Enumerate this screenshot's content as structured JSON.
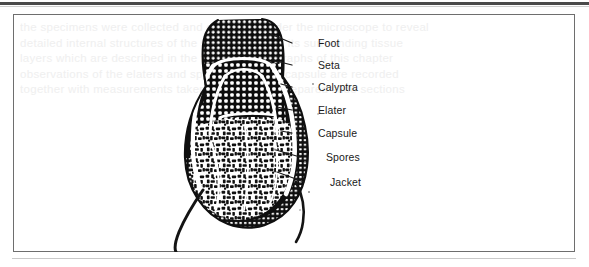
{
  "figure": {
    "kind": "botanical-line-drawing",
    "frame": {
      "border_color": "#6e6e6e",
      "background": "#ffffff"
    },
    "ink_color": "#111111",
    "rules": {
      "top_rule_color": "#4a4a4a",
      "bottom_rule_color": "#c9c9c9"
    }
  },
  "labels": [
    {
      "text": "Foot",
      "x": 318,
      "y": 38,
      "leader_from_x": 292,
      "leader_from_y": 43,
      "tip_x": 268,
      "tip_y": 33
    },
    {
      "text": "Seta",
      "x": 318,
      "y": 60,
      "leader_from_x": 292,
      "leader_from_y": 65,
      "tip_x": 272,
      "tip_y": 60
    },
    {
      "text": "Calyptra",
      "x": 318,
      "y": 82,
      "leader_from_x": 292,
      "leader_from_y": 87,
      "tip_x": 281,
      "tip_y": 84
    },
    {
      "text": "Elater",
      "x": 318,
      "y": 105,
      "leader_from_x": 292,
      "leader_from_y": 110,
      "tip_x": 277,
      "tip_y": 107
    },
    {
      "text": "Capsule",
      "x": 318,
      "y": 128,
      "leader_from_x": 292,
      "leader_from_y": 133,
      "tip_x": 281,
      "tip_y": 131
    },
    {
      "text": "Spores",
      "x": 326,
      "y": 152,
      "leader_from_x": 300,
      "leader_from_y": 157,
      "tip_x": 276,
      "tip_y": 150
    },
    {
      "text": "Jacket",
      "x": 330,
      "y": 177,
      "leader_from_x": 304,
      "leader_from_y": 182,
      "tip_x": 277,
      "tip_y": 172
    }
  ],
  "ghost_lines": [
    "the specimens were collected and examined under the microscope to reveal",
    "detailed internal structures of the sporophyte and its surrounding tissue",
    "layers which are described in the following paragraphs of this chapter",
    "observations of the elaters and spores within the capsule are recorded",
    "together with measurements taken from several prepared slide sections",
    "and compared with earlier published accounts of the same genus"
  ]
}
